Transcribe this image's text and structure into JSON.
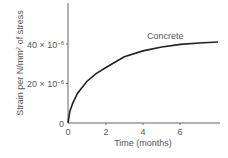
{
  "chart_data": {
    "type": "line",
    "title": "",
    "xlabel": "Time (months)",
    "ylabel": "Strain per N/mm² of stress",
    "x_ticks": [
      "0",
      "2",
      "4",
      "6"
    ],
    "y_ticks": [
      "0",
      "20 × 10⁻⁶",
      "40 × 10⁻⁶"
    ],
    "xlim": [
      0,
      8
    ],
    "ylim": [
      0,
      60
    ],
    "grid": false,
    "legend": "none",
    "annotations": [
      "Concrete"
    ],
    "series": [
      {
        "name": "Concrete",
        "x": [
          0,
          0.1,
          0.25,
          0.5,
          1,
          1.5,
          2,
          3,
          4,
          5,
          6,
          7,
          8
        ],
        "values": [
          0,
          6,
          10,
          15,
          21,
          25,
          28,
          33.5,
          36.5,
          38.5,
          39.8,
          40.5,
          41
        ]
      }
    ]
  },
  "labels": {
    "xlabel": "Time (months)",
    "ylabel_main": "Strain per N/mm",
    "ylabel_sup": "2",
    "ylabel_tail": " of stress",
    "annotation": "Concrete",
    "y0": "0",
    "y20": "20 × 10",
    "y40": "40 × 10",
    "exp": "−6",
    "x0": "0",
    "x2": "2",
    "x4": "4",
    "x6": "6"
  }
}
